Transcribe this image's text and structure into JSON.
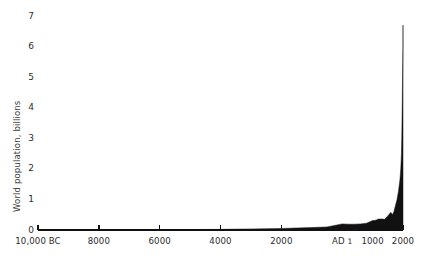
{
  "chart_data": {
    "type": "area",
    "title": "",
    "subtitle": "",
    "xlabel": "",
    "ylabel": "World population, billions",
    "ylim": [
      0,
      7
    ],
    "xlim": [
      -10000,
      2000
    ],
    "grid": false,
    "legend": null,
    "series_color": "#111111",
    "axis_color": "#111111",
    "y_ticks": [
      {
        "value": 7,
        "label": "7"
      },
      {
        "value": 6,
        "label": "6"
      },
      {
        "value": 5,
        "label": "5"
      },
      {
        "value": 4,
        "label": "4"
      },
      {
        "value": 3,
        "label": "3"
      },
      {
        "value": 2,
        "label": "2"
      },
      {
        "value": 1,
        "label": "1"
      },
      {
        "value": 0,
        "label": "0"
      }
    ],
    "x_ticks": [
      {
        "value": -10000,
        "label": "10,000 BC"
      },
      {
        "value": -8000,
        "label": "8000"
      },
      {
        "value": -6000,
        "label": "6000"
      },
      {
        "value": -4000,
        "label": "4000"
      },
      {
        "value": -2000,
        "label": "2000"
      },
      {
        "value": 1,
        "label": "AD 1"
      },
      {
        "value": 1000,
        "label": "1000"
      },
      {
        "value": 2000,
        "label": "2000"
      }
    ],
    "x": [
      -10000,
      -9000,
      -8000,
      -7000,
      -6000,
      -5000,
      -4000,
      -3000,
      -2000,
      -1000,
      -500,
      1,
      200,
      400,
      600,
      800,
      1000,
      1100,
      1200,
      1300,
      1400,
      1500,
      1600,
      1650,
      1700,
      1750,
      1800,
      1850,
      1900,
      1927,
      1950,
      1960,
      1974,
      1987,
      1999,
      2000
    ],
    "values": [
      0.004,
      0.005,
      0.006,
      0.008,
      0.01,
      0.015,
      0.02,
      0.035,
      0.05,
      0.08,
      0.1,
      0.2,
      0.19,
      0.19,
      0.2,
      0.22,
      0.31,
      0.32,
      0.36,
      0.36,
      0.35,
      0.46,
      0.58,
      0.5,
      0.6,
      0.79,
      0.98,
      1.26,
      1.65,
      2.0,
      2.52,
      3.02,
      4.0,
      5.0,
      6.0,
      6.7
    ],
    "units": "billions",
    "peak_value": 6.7,
    "peak_label": ""
  }
}
